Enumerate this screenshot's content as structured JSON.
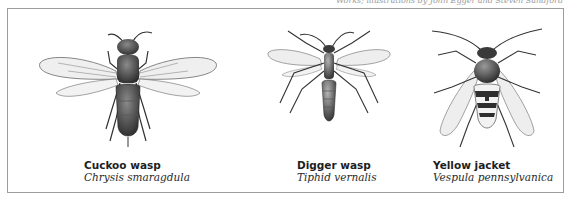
{
  "header": {
    "credit_text": "Works; illustrations by John Egger and Steven Sandford"
  },
  "figures": [
    {
      "id": "cuckoo-wasp",
      "common_name": "Cuckoo wasp",
      "scientific_name": "Chrysis smaragdula",
      "icon": "cuckoo-wasp-illustration"
    },
    {
      "id": "digger-wasp",
      "common_name": "Digger wasp",
      "scientific_name": "Tiphid vernalis",
      "icon": "digger-wasp-illustration"
    },
    {
      "id": "yellow-jacket",
      "common_name": "Yellow jacket",
      "scientific_name": "Vespula pennsylvanica",
      "icon": "yellow-jacket-illustration"
    }
  ],
  "colors": {
    "frame_border": "#9d9d9d",
    "body_dark": "#3a3a3a",
    "wing_fill": "#ececec",
    "caption_text": "#1e1e1e"
  }
}
